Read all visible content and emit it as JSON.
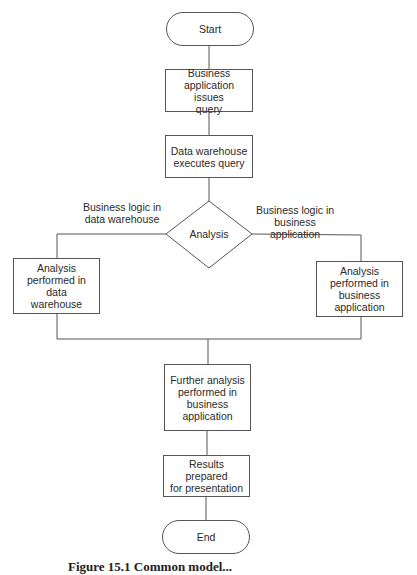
{
  "diagram": {
    "type": "flowchart",
    "nodes": {
      "start": {
        "shape": "terminal",
        "label": "Start"
      },
      "issue_query": {
        "shape": "process",
        "label": "Business\napplication issues\nquery"
      },
      "execute_query": {
        "shape": "process",
        "label": "Data warehouse\nexecutes query"
      },
      "analysis": {
        "shape": "decision",
        "label": "Analysis"
      },
      "analysis_dw": {
        "shape": "process",
        "label": "Analysis\nperformed in data\nwarehouse"
      },
      "analysis_app": {
        "shape": "process",
        "label": "Analysis\nperformed in\nbusiness\napplication"
      },
      "further_analysis": {
        "shape": "process",
        "label": "Further analysis\nperformed in\nbusiness\napplication"
      },
      "results": {
        "shape": "process",
        "label": "Results prepared\nfor presentation"
      },
      "end": {
        "shape": "terminal",
        "label": "End"
      }
    },
    "edge_labels": {
      "left_branch": "Business logic in\ndata warehouse",
      "right_branch": "Business logic in\nbusiness application"
    },
    "edges": [
      {
        "from": "start",
        "to": "issue_query"
      },
      {
        "from": "issue_query",
        "to": "execute_query"
      },
      {
        "from": "execute_query",
        "to": "analysis"
      },
      {
        "from": "analysis",
        "to": "analysis_dw",
        "label": "Business logic in data warehouse"
      },
      {
        "from": "analysis",
        "to": "analysis_app",
        "label": "Business logic in business application"
      },
      {
        "from": "analysis_dw",
        "to": "further_analysis"
      },
      {
        "from": "analysis_app",
        "to": "further_analysis"
      },
      {
        "from": "further_analysis",
        "to": "results"
      },
      {
        "from": "results",
        "to": "end"
      }
    ],
    "caption": "Figure 15.1  Common model...",
    "colors": {
      "stroke": "#555555",
      "text": "#2a2a2a",
      "background": "#ffffff"
    }
  }
}
